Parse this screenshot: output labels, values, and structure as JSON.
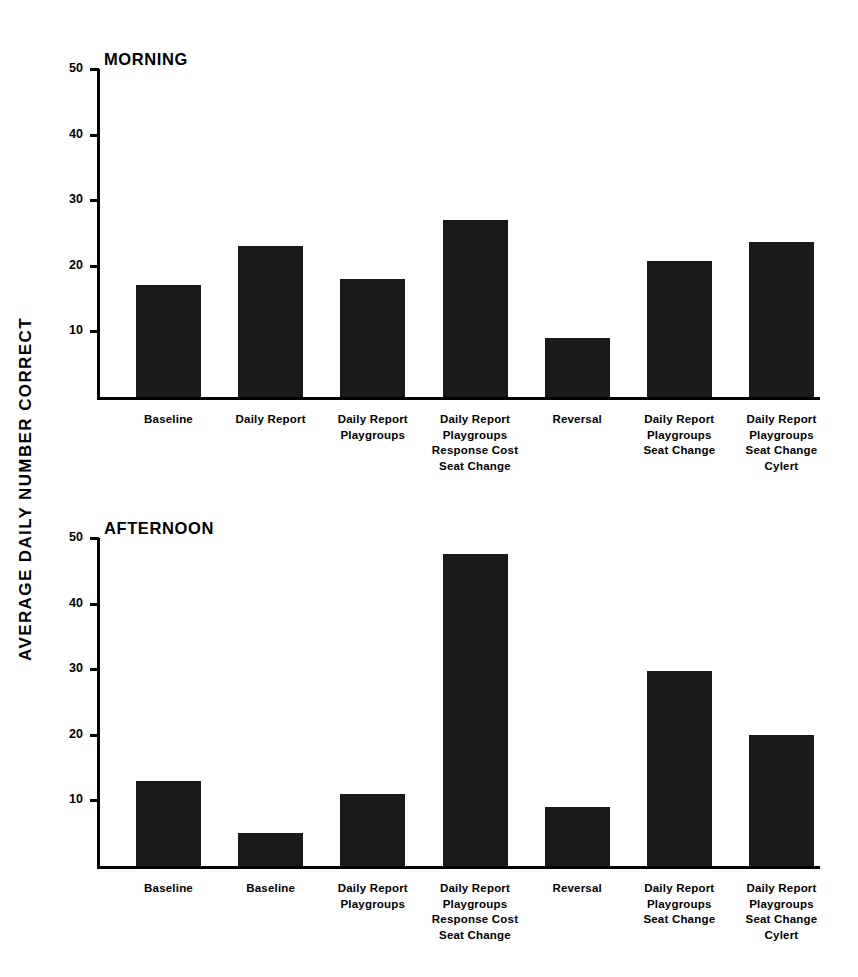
{
  "figure": {
    "y_axis_title": "AVERAGE DAILY NUMBER CORRECT",
    "background_color": "#ffffff",
    "bar_color": "#1a1a1a",
    "axis_color": "#000000"
  },
  "chart_data": [
    {
      "type": "bar",
      "title": "MORNING",
      "xlabel": "",
      "ylabel": "AVERAGE DAILY NUMBER CORRECT",
      "ylim": [
        0,
        50
      ],
      "yticks": [
        10,
        20,
        30,
        40,
        50
      ],
      "ytick_labels": [
        "10",
        "20",
        "30",
        "40",
        "50"
      ],
      "grid": false,
      "legend": "none",
      "categories": [
        "Baseline",
        "Daily Report",
        "Daily Report\nPlaygroups",
        "Daily Report\nPlaygroups\nResponse Cost\nSeat Change",
        "Reversal",
        "Daily Report\nPlaygroups\nSeat Change",
        "Daily Report\nPlaygroups\nSeat Change\nCylert"
      ],
      "values": [
        17,
        23,
        18,
        27,
        9,
        20.8,
        23.6
      ]
    },
    {
      "type": "bar",
      "title": "AFTERNOON",
      "xlabel": "",
      "ylabel": "AVERAGE DAILY NUMBER CORRECT",
      "ylim": [
        0,
        50
      ],
      "yticks": [
        10,
        20,
        30,
        40,
        50
      ],
      "ytick_labels": [
        "10",
        "20",
        "30",
        "40",
        "50"
      ],
      "grid": false,
      "legend": "none",
      "categories": [
        "Baseline",
        "Baseline",
        "Daily Report\nPlaygroups",
        "Daily Report\nPlaygroups\nResponse Cost\nSeat Change",
        "Reversal",
        "Daily Report\nPlaygroups\nSeat Change",
        "Daily Report\nPlaygroups\nSeat Change\nCylert"
      ],
      "values": [
        13,
        5,
        11,
        47.5,
        9,
        29.8,
        20
      ]
    }
  ]
}
